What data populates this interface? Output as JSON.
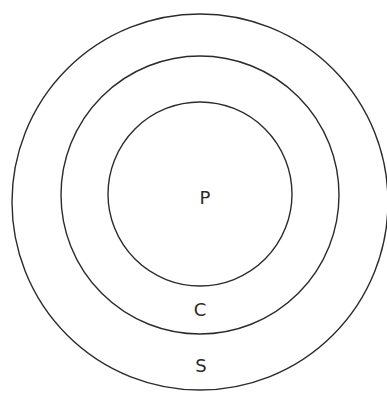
{
  "diagram": {
    "type": "concentric-circles",
    "center": {
      "x": 200,
      "y": 199
    },
    "stroke_color": "#2b2b2b",
    "background": "#ffffff",
    "circles": [
      {
        "id": "outer",
        "radius": 188,
        "label": "S",
        "label_pos": {
          "x": 201,
          "y": 372
        }
      },
      {
        "id": "middle",
        "radius": 140,
        "label": "C",
        "label_pos": {
          "x": 200,
          "y": 316
        }
      },
      {
        "id": "inner",
        "radius": 92,
        "label": "P",
        "label_pos": {
          "x": 204,
          "y": 204
        }
      }
    ]
  }
}
